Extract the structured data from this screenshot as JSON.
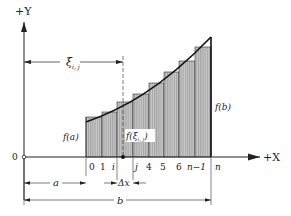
{
  "axes": {
    "y_label": "+Y",
    "x_label": "+X",
    "origin_label": "0"
  },
  "labels": {
    "xi": "ξ",
    "xi_sub": "i, j",
    "f_a": "f(a)",
    "f_b": "f(b)",
    "f_xi": "f(ξ",
    "f_xi_sub": "i, j",
    "f_xi_close": ")",
    "delta_x": "Δx",
    "a": "a",
    "b": "b"
  },
  "ticks": [
    "0",
    "1",
    "i",
    "j",
    "4",
    "5",
    "6",
    "n−1",
    "n"
  ],
  "diagram_data": {
    "type": "riemann-sum",
    "bar_count": 8,
    "bar_edges_x": [
      86,
      102,
      117,
      133,
      149,
      164,
      179,
      195,
      211
    ],
    "bar_tops_y": [
      117,
      112,
      102,
      94,
      83,
      72,
      61,
      47
    ],
    "curve_start": [
      86,
      122
    ],
    "curve_end": [
      211,
      37
    ],
    "x_axis_y": 157,
    "y_axis_x": 24,
    "xi_line_x": 123
  },
  "colors": {
    "ink": "#222222",
    "bar_fill": "#bdbdbd",
    "bar_hatch": "#8a8a8a"
  }
}
